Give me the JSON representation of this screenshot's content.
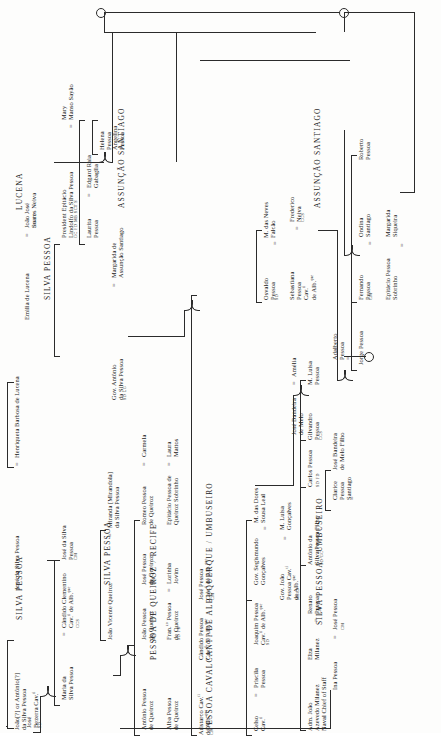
{
  "meta": {
    "orientation": "rotated-90-counterclockwise"
  },
  "family_headers": [
    {
      "id": "lucena",
      "label": "LUCENA"
    },
    {
      "id": "silva_pessoa_top",
      "label": "SILVA PESSOA"
    },
    {
      "id": "silva_pessoa_root",
      "label": "SILVA PESSOA"
    },
    {
      "id": "silva_pessoa_mid",
      "label": "SILVA PESSOA"
    },
    {
      "id": "assuncao_santiago_1",
      "label": "ASSUNÇÃO SANTIAGO"
    },
    {
      "id": "assuncao_santiago_2",
      "label": "ASSUNÇÃO SANTIAGO"
    },
    {
      "id": "pessoa_de_queiroz",
      "label": "PESSOA DE QUEIROZ / RECIFE"
    },
    {
      "id": "pessoa_cavalcanti",
      "label": "PESSOA CAVALCANTI DE ALBUQUERQUE / UMBUSEIRO"
    },
    {
      "id": "silva_pessoa_umbuseiro",
      "label": "SILVA PESSOA / UMBUSEIRO"
    }
  ],
  "people": {
    "joao_antonio_silva_pessoa": {
      "name": "João[?] or Antônio[?]\nda Silva Pessoa"
    },
    "jose_da_silva_pessoa": {
      "name": "José da Silva Pessoa"
    },
    "henriqueta_barbosa": {
      "name": "Henriqueta Barbosa de Lucena"
    },
    "emilia_de_lucena": {
      "name": "Emilia de Lucena"
    },
    "joao_jose_soares_neiva": {
      "name": "João José\nSoares Neiva",
      "codes": "CM   FD"
    },
    "president_epitacio": {
      "name": "President Epitácio\nLindolfo da Silva Pessoa",
      "codes": "GC   FD   MB   SCT   S"
    },
    "mary_manso_sayao": {
      "name": "Mary\nManso Sayão"
    },
    "laurita_pessoa": {
      "name": "Laurita\nPessoa"
    },
    "edgard_raia_gabaglia": {
      "name": "Edgard Raia\nGabaglia"
    },
    "helena_pessoa": {
      "name": "Helena\nPessoa"
    },
    "angelina_pessoa": {
      "name": "Angelina\nPessoa"
    },
    "gov_antonio_da_silva_pessoa": {
      "name": "Gov. Antônio\nda Silva Pessoa",
      "codes": "SD   LG"
    },
    "margarida_assuncao_santiago": {
      "name": "Margarida de\nAssunção Santiago"
    },
    "jose_da_silva_pessoa_2": {
      "name": "José da Silva\nPessoa",
      "codes": "CM"
    },
    "maria_da_silva_pessoa": {
      "name": "Maria da\nSilva Pessoa"
    },
    "candido_clementino": {
      "name": "Cândido Clementino\nCav.ti de Alb.que",
      "codes": "CCS"
    },
    "jose_bezerra_cav": {
      "name": "José\nBezerra Cav.ti",
      "codes": "SD"
    },
    "joao_vicente_queiroz": {
      "name": "João Vicente Queiroz"
    },
    "miranda_mirandola": {
      "name": "Miranda [Mirandola]\nda Silva Pessoa"
    },
    "antonio_pessoa_de_queiroz": {
      "name": "Antônio Pessoa\nde Queiroz"
    },
    "alba_pessoa_de_queiroz": {
      "name": "Alba Pessoa\nde Queiroz"
    },
    "joao_pessoa_de_queiroz": {
      "name": "João Pessoa\nde Queiroz",
      "codes": "SD"
    },
    "jose_pessoa_de_queiroz": {
      "name": "José Pessoa\nde Queiroz",
      "codes": "CM"
    },
    "francisco_pessoa_de_queiroz": {
      "name": "Fran.co Pessoa\nde Queiroz",
      "codes": "SD   FD"
    },
    "lorinha_jovim": {
      "name": "Lorinha\nJovim"
    },
    "romeo_pessoa_de_queiroz": {
      "name": "Romeo Pessoa\nde Queiroz"
    },
    "carmela": {
      "name": "Carmela"
    },
    "epitacio_pessoa_queiroz_sobrinho": {
      "name": "Epitácio Pessoa de\nQueiroz Sobrinho"
    },
    "laura_mattos": {
      "name": "Laura\nMattos"
    },
    "celso_cav": {
      "name": "Celso\nCav.ti",
      "codes": ""
    },
    "priscila_pessoa": {
      "name": "Priscila\nPessoa"
    },
    "joaquim_pessoa_cav": {
      "name": "Joaquim Pessoa\nCav.ti de Alb.que",
      "codes": "SD"
    },
    "gov_segismundo_goncalves": {
      "name": "Gov. Segismundo\nGonçalves"
    },
    "m_das_dores_sousa_leal": {
      "name": "M. das Dores\nSousa Leal"
    },
    "gov_joao_pessoa_cav": {
      "name": "Gov. João\nPessoa Cav.ti\nde Alb.que",
      "codes": "MSCJ"
    },
    "m_luisa_goncalves": {
      "name": "M. Luisa\nGonçalves"
    },
    "aristarco_cav": {
      "name": "Aristarco Cav.ti\nde Alb.que",
      "codes": "CM"
    },
    "candido_pessoa_cav": {
      "name": "Cândido Pessoa\nCav.ti de Alb.que"
    },
    "jose_pessoa_cav": {
      "name": "José Pessoa\nCav.ti de Alb.que",
      "codes": "CM"
    },
    "osvaldo_pessoa": {
      "name": "Osvaldo\nPessoa",
      "codes": "SD"
    },
    "m_das_neves_falcao": {
      "name": "M. das Neves\nFalcão"
    },
    "sebastiana_pessoa_cav": {
      "name": "Sebastiana\nPessoa\nCav.ti\nde Alb.que"
    },
    "frederico_neiva": {
      "name": "Frederico\nNeiva",
      "codes": "CCS"
    },
    "adm_joao_azevedo_milanez": {
      "name": "Adm. João\nAzevedo Milanez\nNaval Chief of Staff"
    },
    "elza_milanez": {
      "name": "Elza\nMilanez"
    },
    "renato_pessoa": {
      "name": "Renato\nPessoa",
      "codes": "CM"
    },
    "ina_pessoa": {
      "name": "Ina Pessoa"
    },
    "jose_pessoa": {
      "name": "José Pessoa",
      "codes": "CM"
    },
    "antonio_da_silva_pessoa_filho": {
      "name": "Antônio da\nSilva Pessoa Filho",
      "codes": "SD   GC"
    },
    "carlos_pessoa": {
      "name": "Carlos Pessoa",
      "codes": "SD   FD"
    },
    "clarice_pessoa_santiago": {
      "name": "Clarice\nPessoa\nSantiago"
    },
    "jose_bandeira_de_melo_filho": {
      "name": "José Bandeira\nde Melo Filho"
    },
    "gilvandro_pessoa": {
      "name": "Gilvandro\nPessoa",
      "codes": "CCS"
    },
    "jose_bandeira_de_melo": {
      "name": "José Bandeira\nde Melo"
    },
    "amelia": {
      "name": "Amélia"
    },
    "m_luisa_pessoa": {
      "name": "M. Luisa\nPessoa"
    },
    "adalberto_pessoa": {
      "name": "Adalberto\nPessoa"
    },
    "jorge_pessoa": {
      "name": "Jorge Pessoa"
    },
    "fernando_pessoa": {
      "name": "Fernando\nPessoa",
      "codes": "CM"
    },
    "ondina_santiago": {
      "name": "Ondina\nSantiago"
    },
    "epitacio_pessoa_sobrinho": {
      "name": "Epitácio Pessoa\nSobrinho"
    },
    "margarida_siqueira": {
      "name": "Margarida\nSiqueira"
    },
    "roberto_pessoa": {
      "name": "Roberto\nPessoa"
    }
  },
  "symbols": {
    "equals": "=",
    "circle": "○"
  }
}
